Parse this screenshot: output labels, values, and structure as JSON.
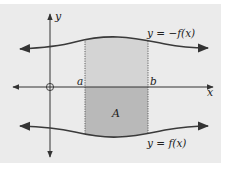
{
  "diagram": {
    "colors": {
      "panel": "#ebebeb",
      "axis": "#333333",
      "curve": "#3a3a3a",
      "shade_upper": "#d4d4d4",
      "shade_lower": "#b9b9b9",
      "dotted": "#555555"
    },
    "axes": {
      "x_label": "x",
      "y_label": "y",
      "origin_marker": "circle"
    },
    "bounds": {
      "a_label": "a",
      "b_label": "b"
    },
    "region": {
      "label": "A"
    },
    "curves": {
      "upper_label": "y = −f(x)",
      "lower_label": "y = f(x)"
    }
  }
}
